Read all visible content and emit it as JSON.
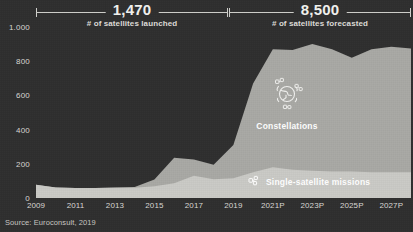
{
  "annotations": {
    "left": {
      "value": "1,470",
      "caption": "# of satellites launched"
    },
    "right": {
      "value": "8,500",
      "caption": "# of satellites forecasted"
    }
  },
  "series_labels": {
    "constellations": "Constellations",
    "single": "Single-satellite missions",
    "constellations_icon": "globe-satellites-icon",
    "single_icon": "satellite-icon"
  },
  "source": "Source: Euroconsult, 2019",
  "colors": {
    "background": "#2e2e2e",
    "constellations": "#a8a8a4",
    "single_satellite": "#c9c9c5",
    "text": "#e8e8e6",
    "axis": "#d9d7d3"
  },
  "chart_data": {
    "type": "area",
    "stacked": true,
    "title": "",
    "subtitle": "",
    "xlabel": "",
    "ylabel": "",
    "ylim": [
      0,
      1000
    ],
    "yticks": [
      "0",
      "200",
      "400",
      "600",
      "800",
      "1.000"
    ],
    "ytick_values": [
      0,
      200,
      400,
      600,
      800,
      1000
    ],
    "grid": false,
    "legend_position": "in-chart",
    "x": [
      "2009",
      "2010",
      "2011",
      "2012",
      "2013",
      "2014",
      "2015",
      "2016",
      "2017",
      "2018",
      "2019",
      "2020P",
      "2021P",
      "2022P",
      "2023P",
      "2024P",
      "2025P",
      "2026P",
      "2027P",
      "2028P"
    ],
    "xtick_labels": [
      "2009",
      "2011",
      "2013",
      "2015",
      "2017",
      "2019",
      "2021P",
      "2023P",
      "2025P",
      "2027P"
    ],
    "series": [
      {
        "name": "Single-satellite missions",
        "color": "#c9c9c5",
        "values": [
          78,
          62,
          58,
          58,
          60,
          60,
          68,
          86,
          130,
          110,
          115,
          150,
          180,
          165,
          160,
          155,
          155,
          150,
          150,
          150
        ]
      },
      {
        "name": "Constellations",
        "color": "#a8a8a4",
        "values": [
          0,
          0,
          0,
          0,
          2,
          5,
          40,
          150,
          95,
          85,
          195,
          520,
          690,
          700,
          740,
          715,
          665,
          720,
          735,
          725
        ]
      }
    ],
    "totals": [
      78,
      62,
      58,
      58,
      62,
      65,
      108,
      236,
      225,
      195,
      310,
      670,
      870,
      865,
      900,
      870,
      820,
      870,
      885,
      875
    ]
  }
}
